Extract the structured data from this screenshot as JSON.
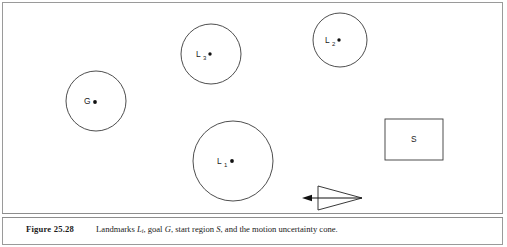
{
  "figure": {
    "number_label": "Figure 25.28",
    "caption_parts": {
      "lead": "Landmarks ",
      "sym_landmark": "L",
      "sym_landmark_sub": "i",
      "mid1": ", goal ",
      "sym_goal": "G",
      "mid2": ", start region ",
      "sym_start": "S",
      "tail": ", and the motion uncertainty cone."
    },
    "caption_full": "Landmarks Li, goal G, start region S, and the motion uncertainty cone."
  },
  "colors": {
    "frame_border": "#9a9a9a",
    "rule": "#8d8d8d",
    "shape_stroke": "#3a3a3a",
    "cone_stroke": "#222222",
    "dot_fill": "#111111",
    "text": "#1a1a1a",
    "background": "#ffffff"
  },
  "diagram": {
    "landmarks": [
      {
        "id": "landmark-3",
        "label": "L",
        "subscript": "3",
        "cx": 211,
        "cy": 54,
        "r": 30,
        "label_x": 196,
        "label_y": 57,
        "sub_x": 203,
        "sub_y": 59.5,
        "dot_x": 210,
        "dot_y": 54,
        "dot_r": 1.7
      },
      {
        "id": "landmark-2",
        "label": "L",
        "subscript": "2",
        "cx": 340,
        "cy": 40,
        "r": 27,
        "label_x": 325,
        "label_y": 43,
        "sub_x": 332,
        "sub_y": 45.5,
        "dot_x": 339,
        "dot_y": 40,
        "dot_r": 1.7
      },
      {
        "id": "landmark-1",
        "label": "L",
        "subscript": "1",
        "cx": 233,
        "cy": 161,
        "r": 40,
        "label_x": 217,
        "label_y": 164,
        "sub_x": 224,
        "sub_y": 166.5,
        "dot_x": 232,
        "dot_y": 161,
        "dot_r": 1.9
      }
    ],
    "goal": {
      "id": "goal-region",
      "label": "G",
      "cx": 96,
      "cy": 101,
      "r": 30,
      "label_x": 84,
      "label_y": 104,
      "dot_x": 95,
      "dot_y": 102,
      "dot_r": 1.9
    },
    "start_region": {
      "id": "start-region",
      "label": "S",
      "x": 385,
      "y": 119,
      "width": 58,
      "height": 41,
      "label_x": 411,
      "label_y": 142
    },
    "uncertainty_cone": {
      "id": "motion-uncertainty-cone",
      "apex_x": 362,
      "apex_y": 198,
      "mouth_x": 318,
      "mouth_top_y": 186,
      "mouth_bottom_y": 210,
      "axis_start_x": 362,
      "axis_start_y": 198,
      "axis_end_x": 310,
      "axis_end_y": 198,
      "arrow_tip_x": 302,
      "arrow_tip_y": 198,
      "arrow_back_x": 312,
      "arrow_half_height": 3.2
    }
  }
}
